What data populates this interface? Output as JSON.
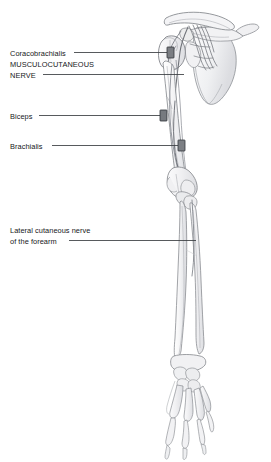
{
  "figure": {
    "background_color": "#ffffff",
    "canvas": {
      "width": 271,
      "height": 462
    },
    "ink": {
      "outline": "#8d9095",
      "outline_dark": "#5d6166",
      "fill_light": "#f4f4f5",
      "fill_mid": "#e9eaec",
      "fill_shadow": "#d9dade",
      "nerve_stroke": "#6e7176",
      "marker_fill": "#7b7e83",
      "marker_stroke": "#3c3f44",
      "leader_line": "#3a3d41",
      "text": "#16181a"
    }
  },
  "labels": [
    {
      "id": "coracobrachialis",
      "text": "Coracobrachialis",
      "style": "mixed-case",
      "leader": {
        "x1": 74,
        "y1": 52,
        "x2": 168,
        "y2": 52
      },
      "marker": {
        "x": 168,
        "y": 47,
        "w": 7,
        "h": 11
      }
    },
    {
      "id": "musculocutaneous-nerve",
      "line1": "MUSCULOCUTANEOUS",
      "line2": "NERVE",
      "style": "all-caps",
      "leader": {
        "x1": 43,
        "y1": 74,
        "x2": 184,
        "y2": 74
      },
      "marker": null
    },
    {
      "id": "biceps",
      "text": "Biceps",
      "style": "mixed-case",
      "leader": {
        "x1": 39,
        "y1": 115,
        "x2": 161,
        "y2": 115
      },
      "marker": {
        "x": 161,
        "y": 110,
        "w": 7,
        "h": 11
      }
    },
    {
      "id": "brachialis",
      "text": "Brachialis",
      "style": "mixed-case",
      "leader": {
        "x1": 52,
        "y1": 145,
        "x2": 179,
        "y2": 145
      },
      "marker": {
        "x": 179,
        "y": 140,
        "w": 7,
        "h": 11
      }
    },
    {
      "id": "lateral-cutaneous-nerve-forearm",
      "line1": "Lateral cutaneous nerve",
      "line2": "of the forearm",
      "style": "mixed-case",
      "leader": {
        "x1": 69,
        "y1": 240,
        "x2": 196,
        "y2": 240
      },
      "marker": null
    }
  ],
  "anatomy_parts": [
    {
      "name": "clavicle",
      "region": "shoulder-girdle"
    },
    {
      "name": "scapula",
      "region": "shoulder-girdle"
    },
    {
      "name": "acromion",
      "region": "shoulder-girdle"
    },
    {
      "name": "coracoid-process",
      "region": "shoulder-girdle"
    },
    {
      "name": "humerus",
      "region": "upper-arm"
    },
    {
      "name": "humeral-head",
      "region": "upper-arm"
    },
    {
      "name": "brachial-plexus-cords",
      "region": "shoulder-girdle"
    },
    {
      "name": "musculocutaneous-nerve",
      "region": "upper-arm"
    },
    {
      "name": "radius",
      "region": "forearm"
    },
    {
      "name": "ulna",
      "region": "forearm"
    },
    {
      "name": "carpals",
      "region": "hand"
    },
    {
      "name": "metacarpals",
      "region": "hand"
    },
    {
      "name": "phalanges",
      "region": "hand"
    }
  ]
}
